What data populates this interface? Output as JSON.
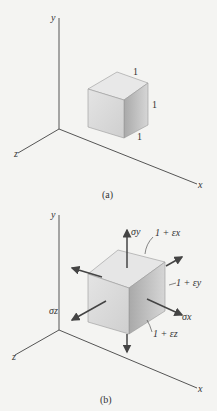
{
  "figure_a": {
    "caption": "(a)",
    "axes": {
      "x": "x",
      "y": "y",
      "z": "z"
    },
    "edge_labels": [
      "1",
      "1",
      "1"
    ]
  },
  "figure_b": {
    "caption": "(b)",
    "axes": {
      "x": "x",
      "y": "y",
      "z": "z"
    },
    "stresses": {
      "sigma_x": "σx",
      "sigma_y": "σy",
      "sigma_z": "σz"
    },
    "edge_labels": {
      "x": "1 + εx",
      "y": "1 + εy",
      "z": "1 + εz"
    }
  },
  "colors": {
    "axis": "#555555",
    "cube_front": "#d9d9d9",
    "cube_top": "#e6e6e6",
    "cube_side": "#b8b8b8",
    "arrow": "#444444"
  }
}
